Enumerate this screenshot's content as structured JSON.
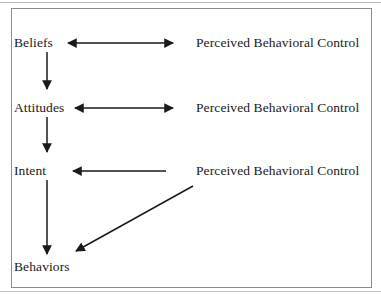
{
  "figure": {
    "background_color": "#ffffff",
    "frame_color": "#8d8d8d",
    "ink_color": "#1a1a1a"
  },
  "nodes": {
    "left_column": [
      {
        "id": "beliefs",
        "label": "Beliefs",
        "x": 14,
        "y": 35
      },
      {
        "id": "attitudes",
        "label": "Attitudes",
        "x": 14,
        "y": 100
      },
      {
        "id": "intent",
        "label": "Intent",
        "x": 14,
        "y": 163
      },
      {
        "id": "behaviors",
        "label": "Behaviors",
        "x": 14,
        "y": 259
      }
    ],
    "right_column": [
      {
        "id": "pbc-1",
        "label": "Perceived Behavioral Control",
        "x": 196,
        "y": 35
      },
      {
        "id": "pbc-2",
        "label": "Perceived Behavioral Control",
        "x": 196,
        "y": 100
      },
      {
        "id": "pbc-3",
        "label": "Perceived Behavioral Control",
        "x": 196,
        "y": 163
      }
    ]
  },
  "connectors": [
    {
      "id": "beliefs-pbc1",
      "kind": "double-headed-horizontal",
      "from": "beliefs",
      "to": "pbc-1",
      "x1": 68,
      "y1": 43,
      "x2": 173,
      "y2": 43
    },
    {
      "id": "attitudes-pbc2",
      "kind": "double-headed-horizontal",
      "from": "attitudes",
      "to": "pbc-2",
      "x1": 75,
      "y1": 108,
      "x2": 173,
      "y2": 108
    },
    {
      "id": "pbc3-intent",
      "kind": "single-headed-horizontal-left",
      "from": "pbc-3",
      "to": "intent",
      "x1": 166,
      "y1": 171,
      "x2": 73,
      "y2": 171
    },
    {
      "id": "beliefs-attitudes",
      "kind": "single-headed-vertical-down",
      "from": "beliefs",
      "to": "attitudes",
      "x1": 47,
      "y1": 52,
      "x2": 47,
      "y2": 89
    },
    {
      "id": "attitudes-intent",
      "kind": "single-headed-vertical-down",
      "from": "attitudes",
      "to": "intent",
      "x1": 47,
      "y1": 117,
      "x2": 47,
      "y2": 152
    },
    {
      "id": "intent-behaviors",
      "kind": "single-headed-vertical-down",
      "from": "intent",
      "to": "behaviors",
      "x1": 47,
      "y1": 180,
      "x2": 47,
      "y2": 254
    },
    {
      "id": "pbc3-behaviors",
      "kind": "single-headed-diagonal",
      "from": "pbc-3",
      "to": "behaviors",
      "x1": 193,
      "y1": 186,
      "x2": 74,
      "y2": 252
    }
  ]
}
